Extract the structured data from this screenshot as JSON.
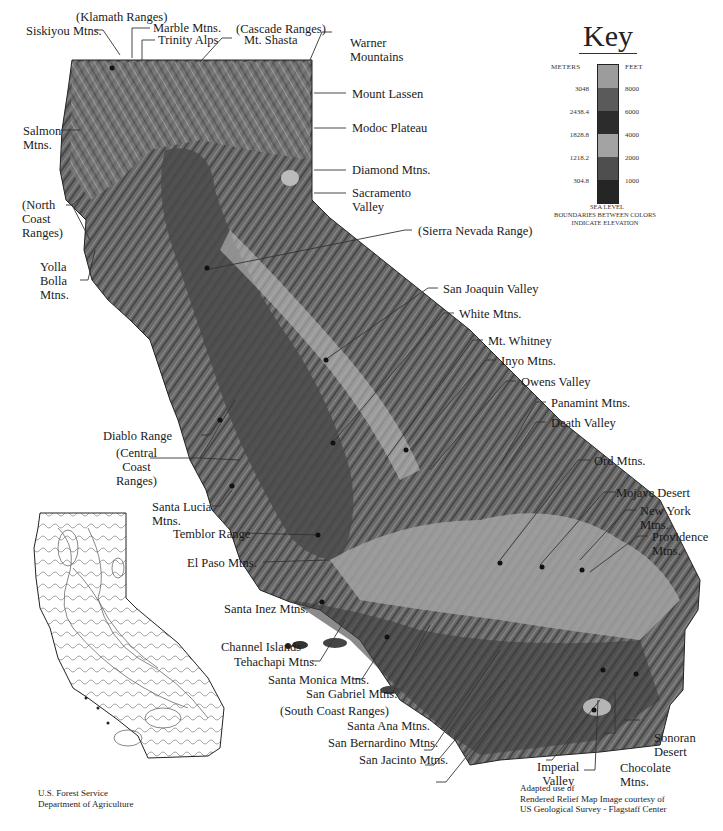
{
  "map": {
    "title": "California Relief Map",
    "colors": {
      "relief_dark": "#3a3a3a",
      "relief_mid": "#6e6e6e",
      "relief_light": "#a8a8a8",
      "valley": "#5a5a5a",
      "desert": "#9a9a9a",
      "leader": "#333333"
    },
    "labels": {
      "klamath": "(Klamath Ranges)",
      "siskiyou": "Siskiyou Mtns.",
      "marble": "Marble Mtns.",
      "trinity": "Trinity Alps",
      "cascade": "(Cascade Ranges)",
      "shasta": "Mt. Shasta",
      "warner": "Warner\nMountains",
      "lassen": "Mount Lassen",
      "modoc": "Modoc Plateau",
      "diamond": "Diamond Mtns.",
      "sacramento": "Sacramento\nValley",
      "salmon": "Salmon\nMtns.",
      "north_coast": "(North\nCoast\nRanges)",
      "yolla": "Yolla\nBolla\nMtns.",
      "sierra": "(Sierra Nevada Range)",
      "san_joaquin": "San Joaquin Valley",
      "white": "White Mtns.",
      "whitney": "Mt. Whitney",
      "inyo": "Inyo Mtns.",
      "owens": "Owens Valley",
      "panamint": "Panamint Mtns.",
      "death_valley": "Death Valley",
      "ord": "Ord Mtns.",
      "mojave": "Mojave Desert",
      "new_york": "New York\nMtns.",
      "providence": "Providence\nMtns.",
      "diablo": "Diablo Range",
      "central_coast": "(Central\nCoast\nRanges)",
      "santa_lucia": "Santa Lucia\nMtns.",
      "temblor": "Temblor Range",
      "el_paso": "El Paso Mtns.",
      "santa_inez": "Santa Inez Mtns.",
      "channel": "Channel Islands",
      "tehachapi": "Tehachapi Mtns.",
      "santa_monica": "Santa Monica Mtns.",
      "san_gabriel": "San Gabriel Mtns.",
      "south_coast": "(South Coast Ranges)",
      "santa_ana": "Santa Ana Mtns.",
      "san_bernardino": "San Bernardino Mtns.",
      "san_jacinto": "San Jacinto Mtns.",
      "imperial": "Imperial\nValley",
      "chocolate": "Chocolate\nMtns.",
      "sonoran": "Sonoran\nDesert"
    }
  },
  "key": {
    "title": "Key",
    "meters_header": "METERS",
    "feet_header": "FEET",
    "bands": [
      {
        "color": "#9c9c9c",
        "meters": "3048",
        "feet": "8000"
      },
      {
        "color": "#5a5a5a",
        "meters": "2438.4",
        "feet": "6000"
      },
      {
        "color": "#2c2c2c",
        "meters": "1828.8",
        "feet": "4000"
      },
      {
        "color": "#a3a3a3",
        "meters": "1218.2",
        "feet": "2000"
      },
      {
        "color": "#4e4e4e",
        "meters": "304.8",
        "feet": "1000"
      },
      {
        "color": "#252525"
      }
    ],
    "sea_level": "SEA LEVEL",
    "note": "BOUNDARIES BETWEEN COLORS\nINDICATE ELEVATION"
  },
  "credits": {
    "left": "U.S. Forest Service\nDepartment of Agriculture",
    "right": "Adapted use of\nRendered Relief Map Image courtesy of\nUS Geological Survey - Flagstaff Center"
  }
}
